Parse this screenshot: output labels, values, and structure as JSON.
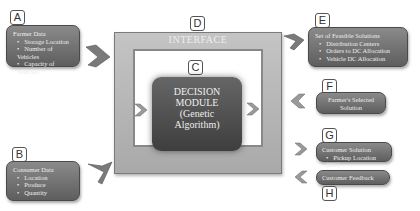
{
  "diagram": {
    "nodes": {
      "A": {
        "tag": "A",
        "title": "Farmer Data",
        "items": [
          "Storage Location",
          "Number of Vehicles",
          "Capacity of Vehicles"
        ]
      },
      "B": {
        "tag": "B",
        "title": "Consumer Data",
        "items": [
          "Location",
          "Produce",
          "Quantity"
        ]
      },
      "C": {
        "tag": "C",
        "line1": "DECISION",
        "line2": "MODULE",
        "line3": "(Genetic",
        "line4": "Algorithm)"
      },
      "D": {
        "tag": "D",
        "title": "INTERFACE"
      },
      "E": {
        "tag": "E",
        "title": "Set of Feasible Solutions",
        "items": [
          "Distribution Centers",
          "Orders to DC Allocation",
          "Vehicle DC Allocation"
        ]
      },
      "F": {
        "tag": "F",
        "line1": "Farmer's Selected",
        "line2": "Solution"
      },
      "G": {
        "tag": "G",
        "title": "Customer Solution",
        "items": [
          "Pickup Location (DC)"
        ]
      },
      "H": {
        "tag": "H",
        "title": "Customer Feedback"
      }
    },
    "colors": {
      "box": "#6e6e6e",
      "frame": "#b8b8b8",
      "core": "#4f4f4f"
    }
  }
}
